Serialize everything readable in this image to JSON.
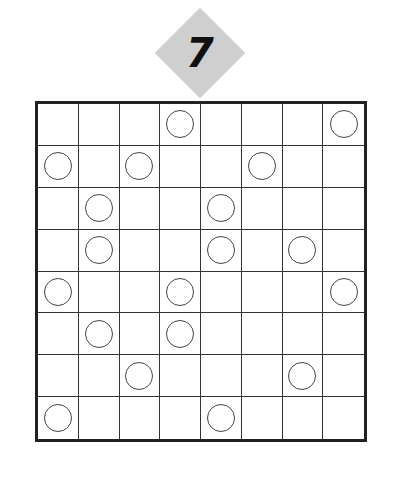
{
  "puzzle": {
    "number": "7",
    "badge_color": "#cfcfcf",
    "rows": 8,
    "cols": 8,
    "circles": [
      [
        3,
        7
      ],
      [
        0,
        2,
        5
      ],
      [
        1,
        4
      ],
      [
        1,
        4,
        6
      ],
      [
        0,
        3,
        7
      ],
      [
        1,
        3
      ],
      [
        2,
        6
      ],
      [
        0,
        4
      ]
    ]
  }
}
